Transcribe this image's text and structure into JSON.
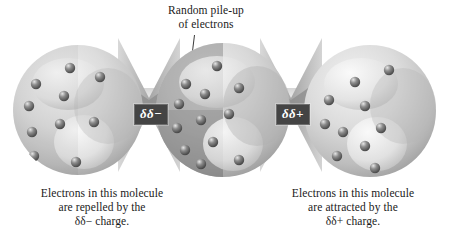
{
  "figure": {
    "background_color": "#ffffff",
    "width": 453,
    "height": 241
  },
  "annotations": {
    "top_label_line1": "Random pile-up",
    "top_label_line2": "of electrons",
    "leader_line_name": "leader-line-to-electron"
  },
  "charges": {
    "negative": {
      "label": "δδ−",
      "background_color": "#444444",
      "text_color": "#ffffff"
    },
    "positive": {
      "label": "δδ+",
      "background_color": "#444444",
      "text_color": "#ffffff"
    }
  },
  "captions": {
    "left": {
      "line1": "Electrons in this molecule",
      "line2": "are repelled by the",
      "line3": "δδ− charge."
    },
    "right": {
      "line1": "Electrons in this molecule",
      "line2": "are attracted by the",
      "line3": "δδ+ charge."
    }
  },
  "molecules": [
    {
      "id": "left",
      "role": "repelled",
      "electron_count": 10,
      "electron_bias": "left",
      "shading": "uniform-light"
    },
    {
      "id": "middle",
      "role": "random pile-up",
      "electron_count": 12,
      "electron_bias": "left",
      "shading": "dark-left-hemisphere"
    },
    {
      "id": "right",
      "role": "attracted",
      "electron_count": 10,
      "electron_bias": "left",
      "shading": "uniform-light"
    }
  ],
  "colors": {
    "sphere_light": "#e9e9e9",
    "sphere_mid": "#c9c9c9",
    "sphere_shadow": "#9a9a9a",
    "sphere_dark_region": "#8e8e8e",
    "electron_fill": "#6b6b6b",
    "electron_highlight": "#e2e2e2",
    "band_fill": "#dedede",
    "bowtie_dark": "#9b9b9b",
    "bowtie_light": "#d2d2d2",
    "text": "#1a1a1a",
    "leader_line": "#3a3a3a"
  }
}
